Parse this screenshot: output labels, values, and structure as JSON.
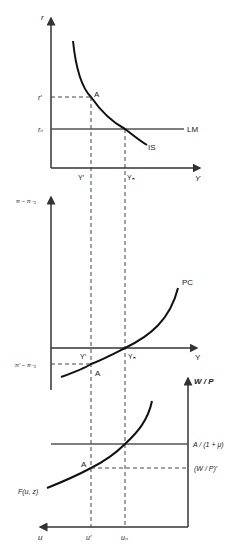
{
  "colors": {
    "axis": "#333333",
    "curve": "#111111",
    "hline": "#555555",
    "dashed": "#444444",
    "background": "#ffffff"
  },
  "panel_islm": {
    "y_axis_label": "r",
    "x_axis_label": "Y",
    "tick_r_prime": "r′",
    "tick_r_n": "rₙ",
    "tick_Y_prime": "Y′",
    "tick_Y_n": "Yₙ",
    "point_label": "A",
    "curve_IS_label": "IS",
    "curve_LM_label": "LM"
  },
  "panel_pc": {
    "y_axis_label": "π − π₋₁",
    "x_axis_label": "Y",
    "tick_pi_prime": "π′ − π₋₁",
    "tick_Y_prime": "Y′",
    "tick_Y_n": "Yₙ",
    "point_label": "A",
    "curve_PC_label": "PC"
  },
  "panel_labor": {
    "y_axis_label": "W / P",
    "x_axis_label": "u",
    "tick_markup": "A / (1 + μ)",
    "tick_wp_prime": "(W / P)′",
    "tick_u_prime": "u′",
    "tick_u_n": "uₙ",
    "point_label": "A",
    "curve_F_label": "F(u, z)"
  }
}
